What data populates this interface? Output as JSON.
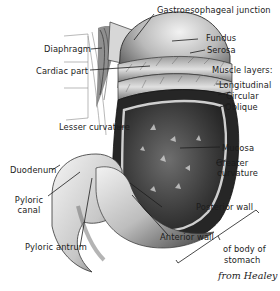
{
  "figure": {
    "credit": "from Healey"
  },
  "labels": {
    "gastroesophageal_junction": "Gastroesophageal junction",
    "fundus": "Fundus",
    "serosa": "Serosa",
    "muscle_layers": "Muscle layers:",
    "longitudinal": "Longitudinal",
    "circular": "Circular",
    "oblique": "Oblique",
    "diaphragm": "Diaphragm",
    "cardiac_part": "Cardiac part",
    "lesser_curvature": "Lesser curvature",
    "mucosa": "Mucosa",
    "greater_curvature_1": "Greater",
    "greater_curvature_2": "curvature",
    "duodenum": "Duodenum",
    "pyloric_canal_1": "Pyloric",
    "pyloric_canal_2": "canal",
    "posterior_wall": "Posterior wall",
    "anterior_wall": "Anterior wall",
    "pyloric_antrum": "Pyloric antrum",
    "body_of_stomach_1": "of body of",
    "body_of_stomach_2": "stomach"
  },
  "colors": {
    "ink": "#1c1c1c",
    "shade_dark": "#2a2a2a",
    "shade_mid": "#8a8a8a",
    "shade_light": "#d9d9d9"
  }
}
